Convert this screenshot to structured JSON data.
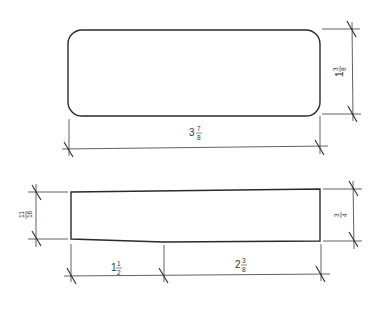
{
  "diagram": {
    "type": "engineering-dimension-drawing",
    "units": "inches",
    "stroke_color": "#2a2a2a",
    "views": {
      "plan": {
        "shape": "rounded-rectangle",
        "dimensions": {
          "width": {
            "whole": "3",
            "num": "7",
            "den": "8",
            "value": 3.875
          },
          "height": {
            "whole": "1",
            "num": "3",
            "den": "8",
            "value": 1.375
          }
        }
      },
      "elevation": {
        "shape": "tapered-block",
        "dimensions": {
          "left_height": {
            "whole": "",
            "num": "11",
            "den": "16",
            "value": 0.6875
          },
          "right_height": {
            "whole": "",
            "num": "3",
            "den": "4",
            "value": 0.75
          },
          "taper_length": {
            "whole": "1",
            "num": "1",
            "den": "2",
            "value": 1.5
          },
          "flat_length": {
            "whole": "2",
            "num": "3",
            "den": "8",
            "value": 2.375
          }
        }
      }
    }
  }
}
